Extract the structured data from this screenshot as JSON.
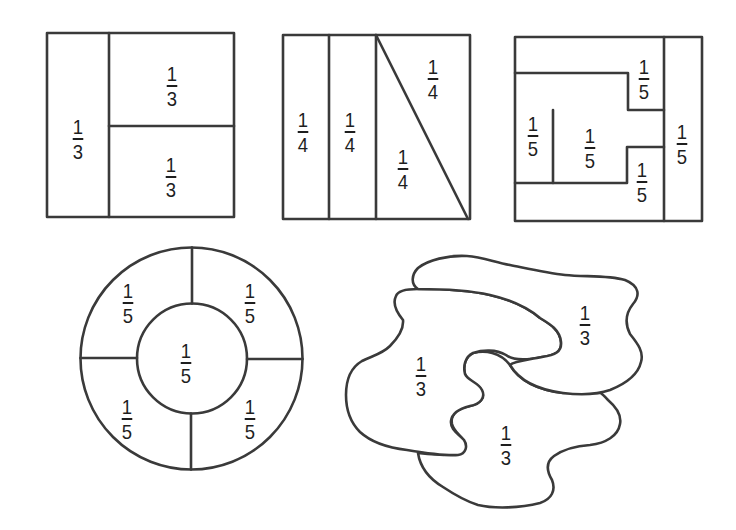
{
  "figures": [
    {
      "id": "square-thirds",
      "shape": "square",
      "parts": 3,
      "labels": [
        {
          "num": "1",
          "den": "3",
          "x": 78,
          "y": 117
        },
        {
          "num": "1",
          "den": "3",
          "x": 172,
          "y": 64
        },
        {
          "num": "1",
          "den": "3",
          "x": 171,
          "y": 155
        }
      ]
    },
    {
      "id": "square-fourths",
      "shape": "square",
      "parts": 4,
      "labels": [
        {
          "num": "1",
          "den": "4",
          "x": 303,
          "y": 110
        },
        {
          "num": "1",
          "den": "4",
          "x": 350,
          "y": 110
        },
        {
          "num": "1",
          "den": "4",
          "x": 433,
          "y": 57
        },
        {
          "num": "1",
          "den": "4",
          "x": 403,
          "y": 147
        }
      ]
    },
    {
      "id": "square-fifths",
      "shape": "square",
      "parts": 5,
      "labels": [
        {
          "num": "1",
          "den": "5",
          "x": 644,
          "y": 57
        },
        {
          "num": "1",
          "den": "5",
          "x": 533,
          "y": 114
        },
        {
          "num": "1",
          "den": "5",
          "x": 590,
          "y": 126
        },
        {
          "num": "1",
          "den": "5",
          "x": 642,
          "y": 160
        },
        {
          "num": "1",
          "den": "5",
          "x": 682,
          "y": 122
        }
      ]
    },
    {
      "id": "circle-fifths",
      "shape": "ring-with-center",
      "parts": 5,
      "labels": [
        {
          "num": "1",
          "den": "5",
          "x": 128,
          "y": 281
        },
        {
          "num": "1",
          "den": "5",
          "x": 250,
          "y": 281
        },
        {
          "num": "1",
          "den": "5",
          "x": 186,
          "y": 341
        },
        {
          "num": "1",
          "den": "5",
          "x": 127,
          "y": 397
        },
        {
          "num": "1",
          "den": "5",
          "x": 250,
          "y": 397
        }
      ]
    },
    {
      "id": "blob-thirds",
      "shape": "irregular",
      "parts": 3,
      "labels": [
        {
          "num": "1",
          "den": "3",
          "x": 585,
          "y": 303
        },
        {
          "num": "1",
          "den": "3",
          "x": 421,
          "y": 354
        },
        {
          "num": "1",
          "den": "3",
          "x": 506,
          "y": 423
        }
      ]
    }
  ]
}
